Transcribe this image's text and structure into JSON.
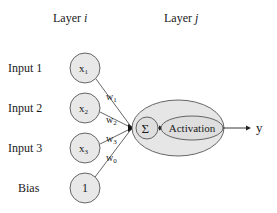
{
  "diagram": {
    "layer_i_label": "Layer ",
    "layer_i_var": "i",
    "layer_j_label": "Layer ",
    "layer_j_var": "j",
    "inputs": [
      {
        "label": "Input 1",
        "node": "x",
        "sub": "1"
      },
      {
        "label": "Input 2",
        "node": "x",
        "sub": "2"
      },
      {
        "label": "Input 3",
        "node": "x",
        "sub": "3"
      },
      {
        "label": "Bias",
        "node": "1",
        "sub": ""
      }
    ],
    "weights": [
      {
        "w": "w",
        "sub": "1"
      },
      {
        "w": "w",
        "sub": "2"
      },
      {
        "w": "w",
        "sub": "3"
      },
      {
        "w": "w",
        "sub": "0"
      }
    ],
    "sum_symbol": "Σ",
    "activation_label": "Activation",
    "output_label": "y",
    "colors": {
      "node_fill": "#e8e8e8",
      "stroke": "#555555",
      "text": "#1a1a1a"
    }
  }
}
